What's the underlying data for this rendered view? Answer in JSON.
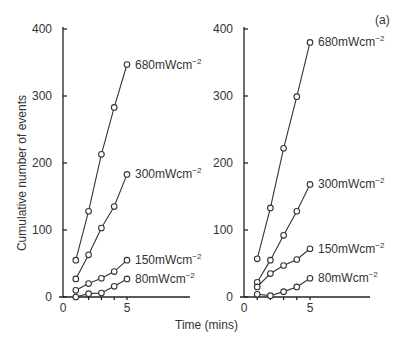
{
  "figure": {
    "panel_label": "(a)",
    "ylabel": "Cumulative number of events",
    "xlabel": "Time (mins)"
  },
  "chart_data": [
    {
      "type": "line",
      "title": "",
      "xlabel": "Time (mins)",
      "ylabel": "Cumulative number of events",
      "x": [
        1,
        2,
        3,
        4,
        5
      ],
      "xlim": [
        0,
        10
      ],
      "ylim": [
        0,
        400
      ],
      "xticks": [
        "0",
        "5"
      ],
      "yticks": [
        "0",
        "100",
        "200",
        "300",
        "400"
      ],
      "grid": false,
      "legend": "inline labels at line ends",
      "series": [
        {
          "name": "680mWcm⁻²",
          "values": [
            55,
            128,
            213,
            283,
            347
          ]
        },
        {
          "name": "300mWcm⁻²",
          "values": [
            27,
            63,
            103,
            135,
            183
          ]
        },
        {
          "name": "150mWcm⁻²",
          "values": [
            10,
            20,
            28,
            38,
            55
          ]
        },
        {
          "name": "80mWcm⁻²",
          "values": [
            0,
            5,
            6,
            16,
            27
          ]
        }
      ]
    },
    {
      "type": "line",
      "title": "(a)",
      "xlabel": "Time (mins)",
      "ylabel": "",
      "x": [
        1,
        2,
        3,
        4,
        5
      ],
      "xlim": [
        0,
        10
      ],
      "ylim": [
        0,
        400
      ],
      "xticks": [
        "0",
        "5"
      ],
      "yticks": [
        "0",
        "100",
        "200",
        "300",
        "400"
      ],
      "grid": false,
      "legend": "inline labels at line ends",
      "series": [
        {
          "name": "680mWcm⁻²",
          "values": [
            57,
            133,
            222,
            299,
            380
          ]
        },
        {
          "name": "300mWcm⁻²",
          "values": [
            22,
            55,
            92,
            128,
            168
          ]
        },
        {
          "name": "150mWcm⁻²",
          "values": [
            15,
            35,
            47,
            56,
            72
          ]
        },
        {
          "name": "80mWcm⁻²",
          "values": [
            4,
            2,
            8,
            15,
            28
          ]
        }
      ]
    }
  ]
}
